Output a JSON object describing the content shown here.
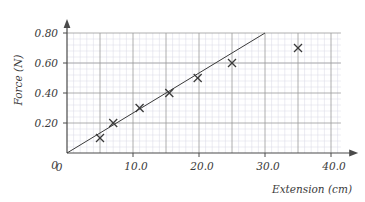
{
  "chart_data": {
    "type": "scatter",
    "title": "",
    "xlabel": "Extension (cm)",
    "ylabel": "Force (N)",
    "xlim": [
      0,
      42
    ],
    "ylim": [
      0,
      0.88
    ],
    "grid": true,
    "minor_grid": true,
    "legend": "none",
    "x_ticks": [
      {
        "value": 0,
        "label": "0"
      },
      {
        "value": 10,
        "label": "10.0"
      },
      {
        "value": 20,
        "label": "20.0"
      },
      {
        "value": 30,
        "label": "30.0"
      },
      {
        "value": 40,
        "label": "40.0"
      }
    ],
    "y_ticks": [
      {
        "value": 0,
        "label": "0"
      },
      {
        "value": 0.2,
        "label": "0.20"
      },
      {
        "value": 0.4,
        "label": "0.40"
      },
      {
        "value": 0.6,
        "label": "0.60"
      },
      {
        "value": 0.8,
        "label": "0.80"
      }
    ],
    "major_gridlines_x": [
      5,
      10,
      15,
      20,
      25,
      30,
      35,
      40
    ],
    "major_gridlines_y": [
      0.2,
      0.4,
      0.6,
      0.8
    ],
    "points": [
      {
        "x": 5.0,
        "y": 0.1
      },
      {
        "x": 7.0,
        "y": 0.2
      },
      {
        "x": 11.0,
        "y": 0.3
      },
      {
        "x": 15.5,
        "y": 0.4
      },
      {
        "x": 19.8,
        "y": 0.5
      },
      {
        "x": 25.0,
        "y": 0.6
      },
      {
        "x": 35.0,
        "y": 0.7
      }
    ],
    "marker": "x",
    "fit_line": {
      "from": {
        "x": 0,
        "y": 0
      },
      "to": {
        "x": 30,
        "y": 0.8
      },
      "label": "best-fit line"
    },
    "colors": {
      "axis": "#4a4a4a",
      "major_grid": "#9a9a9a",
      "minor_grid": "#d8d8e4",
      "marker": "#3a3a3a",
      "fit_line": "#3a3a3a",
      "text": "#3a3a3a",
      "background": "#ffffff"
    }
  }
}
